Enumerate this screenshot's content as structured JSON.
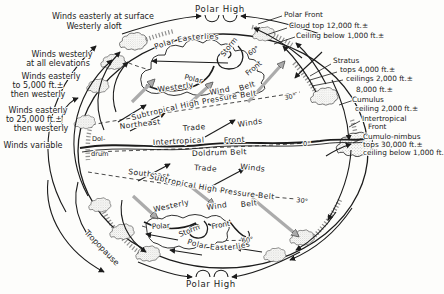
{
  "figure": {
    "polar_high_top": "Polar High",
    "polar_high_bottom": "Polar High",
    "tropopause": "Tropopause"
  },
  "colors": {
    "ink": "#1c1c1c",
    "gray_arrow": "#a9a9a9",
    "paper": "#fdfdfb"
  },
  "left_annotations": [
    {
      "lines": [
        "Winds easterly at surface",
        "Westerly aloft"
      ]
    },
    {
      "lines": [
        "Winds westerly",
        "at all elevations"
      ]
    },
    {
      "lines": [
        "Winds easterly",
        "to 5,000 ft.±",
        "then westerly"
      ]
    },
    {
      "lines": [
        "Winds easterly",
        "to 25,000 ft.±",
        "then westerly"
      ]
    },
    {
      "lines": [
        "Winds variable"
      ]
    }
  ],
  "right_annotations": [
    {
      "lines": [
        "Polar Front"
      ]
    },
    {
      "lines": [
        "Cloud top 12,000 ft.±"
      ]
    },
    {
      "lines": [
        "Ceiling below 1,000 ft.±"
      ]
    },
    {
      "lines": [
        "Stratus",
        "tops 4,000 ft.±",
        "ceilings 2,000 ft.±"
      ]
    },
    {
      "lines": [
        "8,000 ft.±"
      ]
    },
    {
      "lines": [
        "Cumulus",
        "ceiling 2,000 ft.±"
      ]
    },
    {
      "lines": [
        "Intertropical",
        "Front"
      ]
    },
    {
      "lines": [
        "Cumulo-nimbus",
        "tops 30,000 ft.±",
        "ceiling below 1,000 ft."
      ]
    }
  ],
  "belts": {
    "polar_easterlies_n": "Polar  Easterlies",
    "storm_n": "Storm",
    "polar_front_n": [
      "Polar",
      "Front"
    ],
    "westerly_n": [
      "Westerly",
      "Wind",
      "Belt"
    ],
    "subtropical_n": "Subtropical High Pressure Belt",
    "ne_trades": [
      "Northeast",
      "Trade",
      "Winds"
    ],
    "itf": [
      "Intertropical",
      "Front"
    ],
    "doldrum": "Doldrum Belt",
    "doldrum_edge": [
      "Dol-",
      "drum"
    ],
    "se_trades": [
      "Southeast",
      "Trade",
      "Winds"
    ],
    "subtropical_s": "Subtropical High Pressure Belt",
    "westerly_s": [
      "Westerly",
      "Wind",
      "Belt"
    ],
    "polar_front_s": [
      "Polar",
      "Front"
    ],
    "storm_s": "Storm",
    "polar_easterlies_s": "Polar  Easterlies"
  },
  "latitudes": {
    "n60": "60°",
    "n30": "30°",
    "eq": "0°",
    "s30": "30°",
    "s60": "60°"
  }
}
